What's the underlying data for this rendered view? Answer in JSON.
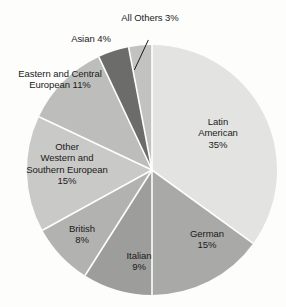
{
  "chart_data": {
    "type": "pie",
    "title": "",
    "subtitle": "",
    "xlabel": "",
    "ylabel": "",
    "grid": false,
    "legend_position": "none",
    "label_format": "name + percent",
    "start_angle_deg": 0,
    "direction": "clockwise",
    "total_percent": 100,
    "categories": [
      "Latin American",
      "German",
      "Italian",
      "British",
      "Other Western and Southern European",
      "Eastern and Central European",
      "Asian",
      "All Others"
    ],
    "values": [
      35,
      15,
      9,
      8,
      15,
      11,
      4,
      3
    ],
    "slices": [
      {
        "name": "Latin American",
        "value": 35,
        "percent_label": "35%",
        "color": "#e3e3e1",
        "label_lines": [
          "Latin",
          "American",
          "35%"
        ],
        "leader_line": false
      },
      {
        "name": "German",
        "value": 15,
        "percent_label": "15%",
        "color": "#a9a9a7",
        "label_lines": [
          "German",
          "15%"
        ],
        "leader_line": false
      },
      {
        "name": "Italian",
        "value": 9,
        "percent_label": "9%",
        "color": "#9d9d9b",
        "label_lines": [
          "Italian",
          "9%"
        ],
        "leader_line": false
      },
      {
        "name": "British",
        "value": 8,
        "percent_label": "8%",
        "color": "#b2b2b0",
        "label_lines": [
          "British",
          "8%"
        ],
        "leader_line": false
      },
      {
        "name": "Other Western and Southern European",
        "value": 15,
        "percent_label": "15%",
        "color": "#c9c9c7",
        "label_lines": [
          "Other",
          "Western and",
          "Southern European",
          "15%"
        ],
        "leader_line": false
      },
      {
        "name": "Eastern and Central European",
        "value": 11,
        "percent_label": "11%",
        "color": "#bdbdbb",
        "label_lines": [
          "Eastern and Central",
          "European 11%"
        ],
        "leader_line": false
      },
      {
        "name": "Asian",
        "value": 4,
        "percent_label": "4%",
        "color": "#6c6c6a",
        "label_lines": [
          "Asian 4%"
        ],
        "leader_line": false
      },
      {
        "name": "All Others",
        "value": 3,
        "percent_label": "3%",
        "color": "#c2c2c0",
        "label_lines": [
          "All Others 3%"
        ],
        "leader_line": true
      }
    ]
  },
  "labels": {
    "latin_american": "Latin\nAmerican\n35%",
    "german": "German\n15%",
    "italian": "Italian\n9%",
    "british": "British\n8%",
    "other_western": "Other\nWestern and\nSouthern European\n15%",
    "eastern_central": "Eastern and Central\nEuropean 11%",
    "asian": "Asian 4%",
    "all_others": "All Others 3%"
  },
  "geometry": {
    "center_x": 152,
    "center_y": 170,
    "radius": 125,
    "divider_color": "#ffffff",
    "divider_width": 1.6,
    "background": "#fdfdfc",
    "text_color": "#1b1b1b"
  }
}
